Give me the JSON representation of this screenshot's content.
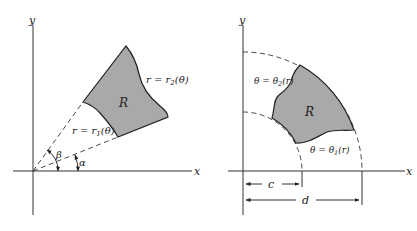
{
  "left_diagram": {
    "axis_x_label": "x",
    "axis_y_label": "y",
    "region_label": "R",
    "outer_curve_label": "r = r",
    "outer_curve_sub": "2",
    "outer_curve_arg": "(θ)",
    "inner_curve_label": "r = r",
    "inner_curve_sub": "1",
    "inner_curve_arg": "(θ)",
    "angle_lower_label": "α",
    "angle_upper_label": "β"
  },
  "right_diagram": {
    "axis_x_label": "x",
    "axis_y_label": "y",
    "region_label": "R",
    "upper_curve_label": "θ = θ",
    "upper_curve_sub": "2",
    "upper_curve_arg": "(r)",
    "lower_curve_label": "θ = θ",
    "lower_curve_sub": "1",
    "lower_curve_arg": "(r)",
    "inner_radius_label": "c",
    "outer_radius_label": "d"
  },
  "colors": {
    "region_fill": "#a9a9a9",
    "line": "#222222",
    "background": "#ffffff"
  }
}
